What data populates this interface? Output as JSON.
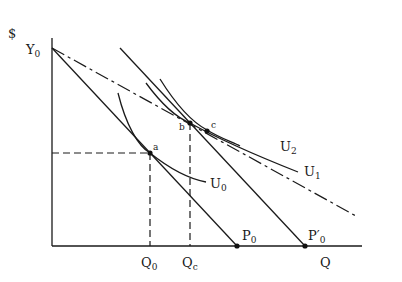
{
  "diagram": {
    "axes": {
      "y_label": "$",
      "x_label": "Q"
    },
    "labels": {
      "y0": {
        "main": "Y",
        "sub": "0"
      },
      "p0": {
        "main": "P",
        "sub": "0"
      },
      "p0_prime": {
        "main": "P′",
        "sub": "0"
      },
      "q0": {
        "main": "Q",
        "sub": "0"
      },
      "qc": {
        "main": "Q",
        "sub": "c"
      },
      "u0": {
        "main": "U",
        "sub": "0"
      },
      "u1": {
        "main": "U",
        "sub": "1"
      },
      "u2": {
        "main": "U",
        "sub": "2"
      }
    },
    "points": {
      "a": "a",
      "b": "b",
      "c": "c"
    },
    "elements": [
      "budget line Y0-P0 (solid)",
      "budget line through b to P'0 (solid)",
      "budget line from Y0 through c (dash-dot)",
      "indifference curves U0, U1, U2",
      "dashed projections from a to axes and from b to Qc"
    ]
  }
}
